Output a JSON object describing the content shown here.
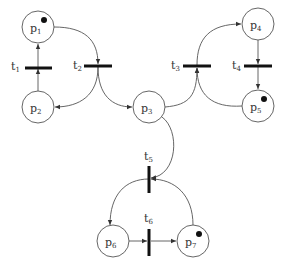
{
  "diagram": {
    "type": "petri-net",
    "places": [
      {
        "id": "p1",
        "label": "p",
        "sub": "1",
        "tokens": 1
      },
      {
        "id": "p2",
        "label": "p",
        "sub": "2",
        "tokens": 0
      },
      {
        "id": "p3",
        "label": "p",
        "sub": "3",
        "tokens": 0
      },
      {
        "id": "p4",
        "label": "p",
        "sub": "4",
        "tokens": 0
      },
      {
        "id": "p5",
        "label": "p",
        "sub": "5",
        "tokens": 1
      },
      {
        "id": "p6",
        "label": "p",
        "sub": "6",
        "tokens": 0
      },
      {
        "id": "p7",
        "label": "p",
        "sub": "7",
        "tokens": 1
      }
    ],
    "transitions": [
      {
        "id": "t1",
        "label": "t",
        "sub": "1"
      },
      {
        "id": "t2",
        "label": "t",
        "sub": "2"
      },
      {
        "id": "t3",
        "label": "t",
        "sub": "3"
      },
      {
        "id": "t4",
        "label": "t",
        "sub": "4"
      },
      {
        "id": "t5",
        "label": "t",
        "sub": "5"
      },
      {
        "id": "t6",
        "label": "t",
        "sub": "6"
      }
    ],
    "arcs": [
      {
        "from": "p2",
        "to": "t1"
      },
      {
        "from": "t1",
        "to": "p1"
      },
      {
        "from": "p1",
        "to": "t2"
      },
      {
        "from": "t2",
        "to": "p2"
      },
      {
        "from": "t2",
        "to": "p3"
      },
      {
        "from": "p3",
        "to": "t3"
      },
      {
        "from": "p5",
        "to": "t3"
      },
      {
        "from": "t3",
        "to": "p4"
      },
      {
        "from": "p4",
        "to": "t4"
      },
      {
        "from": "t4",
        "to": "p5"
      },
      {
        "from": "p3",
        "to": "t5"
      },
      {
        "from": "p7",
        "to": "t5"
      },
      {
        "from": "t5",
        "to": "p6"
      },
      {
        "from": "p6",
        "to": "t6"
      },
      {
        "from": "t6",
        "to": "p7"
      }
    ]
  }
}
